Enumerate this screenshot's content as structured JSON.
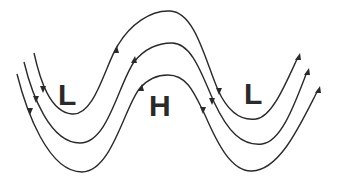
{
  "diagram": {
    "type": "pressure-wave-flow-lines",
    "labels": [
      {
        "text": "L",
        "meaning": "low-pressure trough",
        "x": 56,
        "y": 80
      },
      {
        "text": "H",
        "meaning": "high-pressure ridge",
        "x": 149,
        "y": 89
      },
      {
        "text": "L",
        "meaning": "low-pressure trough",
        "x": 243,
        "y": 79
      }
    ],
    "flow_lines": 3,
    "line_color": "#2a2a2a",
    "arrow_direction": "left-to-right"
  }
}
